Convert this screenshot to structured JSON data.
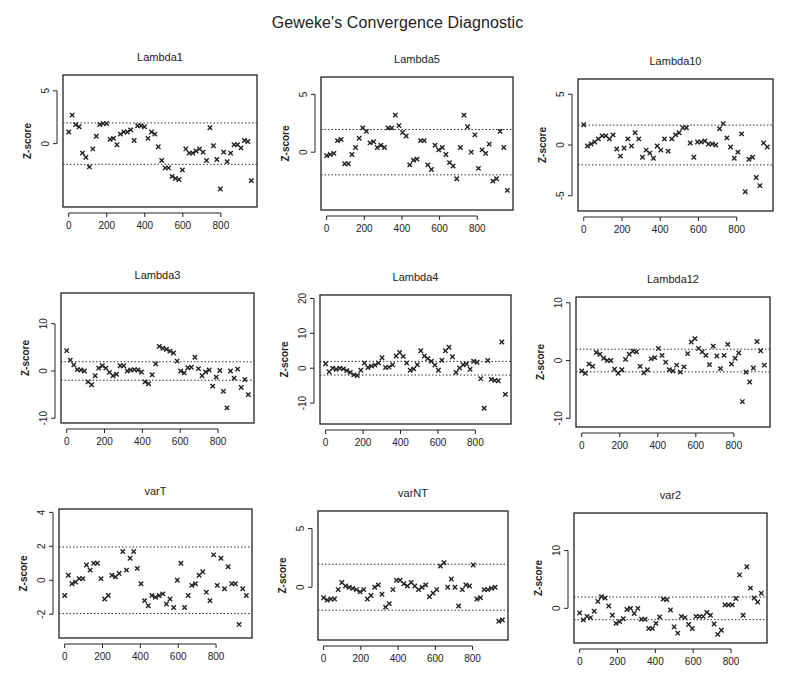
{
  "title": "Geweke's Convergence Diagnostic",
  "chart_data": [
    {
      "type": "scatter",
      "title": "Lambda1",
      "xlabel": "",
      "ylabel": "Z-score",
      "xlim": [
        -30,
        990
      ],
      "ylim": [
        -6,
        6.5
      ],
      "xticks": [
        0,
        200,
        400,
        600,
        800
      ],
      "yticks": [
        0,
        5
      ],
      "hlines": [
        1.96,
        -1.96
      ],
      "grid": false,
      "marker": "x",
      "y": [
        1.1,
        2.7,
        1.8,
        1.6,
        -0.9,
        -1.3,
        -2.2,
        -0.5,
        0.7,
        1.8,
        1.9,
        1.9,
        0.4,
        0.5,
        -0.1,
        0.9,
        1.1,
        1.1,
        1.3,
        0.3,
        1.7,
        1.7,
        1.6,
        0.5,
        1.1,
        0.9,
        -0.3,
        -1.6,
        -2.3,
        -2.3,
        -3.1,
        -3.3,
        -3.4,
        -2.5,
        -0.5,
        -0.9,
        -0.9,
        -0.7,
        -0.5,
        -0.8,
        -1.6,
        1.5,
        -0.2,
        -1.5,
        -4.3,
        -0.8,
        -1.7,
        -0.9,
        -0.1,
        -0.1,
        -0.4,
        0.3,
        0.2,
        -3.5
      ]
    },
    {
      "type": "scatter",
      "title": "Lambda5",
      "xlabel": "",
      "ylabel": "Z-score",
      "xlim": [
        -30,
        990
      ],
      "ylim": [
        -5,
        6.5
      ],
      "xticks": [
        0,
        200,
        400,
        600,
        800
      ],
      "yticks": [
        0,
        5
      ],
      "hlines": [
        1.96,
        -1.96
      ],
      "grid": false,
      "marker": "x",
      "y": [
        -0.3,
        -0.2,
        -0.1,
        1.0,
        1.1,
        -1.0,
        -1.0,
        -0.2,
        0.4,
        1.2,
        2.1,
        1.8,
        0.8,
        0.9,
        0.4,
        0.6,
        0.4,
        2.1,
        2.1,
        3.2,
        2.3,
        1.7,
        1.4,
        -1.1,
        -0.7,
        -0.6,
        1.0,
        1.0,
        -1.1,
        -1.5,
        0.6,
        0.2,
        0.4,
        -0.2,
        -0.9,
        -1.2,
        -2.3,
        0.4,
        3.2,
        2.2,
        0.0,
        1.5,
        -1.4,
        0.2,
        -0.1,
        0.7,
        -2.5,
        -2.3,
        1.8,
        0.4,
        -3.3
      ]
    },
    {
      "type": "scatter",
      "title": "Lambda10",
      "xlabel": "",
      "ylabel": "Z-score",
      "xlim": [
        -30,
        990
      ],
      "ylim": [
        -6.5,
        6.5
      ],
      "xticks": [
        0,
        200,
        400,
        600,
        800
      ],
      "yticks": [
        -5,
        0,
        5
      ],
      "hlines": [
        1.96,
        -1.96
      ],
      "grid": false,
      "marker": "x",
      "y": [
        2.0,
        -0.1,
        0.1,
        0.3,
        0.6,
        0.9,
        0.9,
        0.6,
        1.0,
        -0.4,
        -1.1,
        -0.3,
        0.6,
        -0.1,
        1.2,
        0.6,
        -1.2,
        -0.5,
        -0.8,
        -1.3,
        -0.1,
        -0.5,
        0.6,
        -0.6,
        0.6,
        1.0,
        1.2,
        1.7,
        1.7,
        0.2,
        -1.2,
        0.3,
        0.3,
        0.4,
        0.1,
        0.1,
        0.0,
        1.6,
        2.1,
        0.7,
        -0.2,
        -1.3,
        -0.7,
        1.1,
        -4.6,
        -1.4,
        -1.2,
        -3.2,
        -4.0,
        0.2,
        -0.2
      ]
    },
    {
      "type": "scatter",
      "title": "Lambda3",
      "xlabel": "",
      "ylabel": "Z-score",
      "xlim": [
        -30,
        990
      ],
      "ylim": [
        -11,
        16.5
      ],
      "xticks": [
        0,
        200,
        400,
        600,
        800
      ],
      "yticks": [
        -10,
        0,
        10
      ],
      "hlines": [
        1.96,
        -1.96
      ],
      "grid": false,
      "marker": "x",
      "y": [
        4.3,
        2.3,
        1.3,
        0.3,
        0.2,
        0.0,
        -2.3,
        -2.9,
        -1.0,
        0.6,
        1.1,
        0.6,
        -0.3,
        -1.0,
        -0.7,
        1.1,
        1.1,
        0.0,
        0.2,
        0.3,
        0.2,
        -0.2,
        -2.3,
        -2.7,
        -0.8,
        1.5,
        5.2,
        4.8,
        4.6,
        4.2,
        3.8,
        2.1,
        0.0,
        -0.4,
        0.7,
        0.8,
        2.9,
        0.5,
        -1.0,
        -0.2,
        0.2,
        -3.2,
        -1.3,
        0.1,
        -4.3,
        -7.8,
        0.0,
        -1.5,
        0.4,
        -3.5,
        -1.8,
        -5.0
      ]
    },
    {
      "type": "scatter",
      "title": "Lambda4",
      "xlabel": "",
      "ylabel": "Z-score",
      "xlim": [
        -30,
        990
      ],
      "ylim": [
        -16,
        21
      ],
      "xticks": [
        0,
        200,
        400,
        600,
        800
      ],
      "yticks": [
        -10,
        0,
        10,
        20
      ],
      "hlines": [
        1.96,
        -1.96
      ],
      "grid": false,
      "marker": "x",
      "y": [
        1.3,
        -1.0,
        0.0,
        -0.3,
        0.0,
        -0.2,
        -0.7,
        -1.2,
        -1.9,
        -2.1,
        -0.6,
        1.5,
        0.2,
        0.6,
        0.9,
        1.5,
        3.0,
        0.2,
        0.3,
        1.0,
        3.5,
        4.5,
        3.4,
        1.5,
        -0.6,
        -0.2,
        1.0,
        5.0,
        3.5,
        2.8,
        2.0,
        0.9,
        -0.6,
        2.3,
        5.0,
        6.0,
        3.3,
        -1.2,
        0.1,
        1.0,
        1.2,
        -0.3,
        2.0,
        1.7,
        -3.0,
        -11.5,
        2.2,
        -3.2,
        -3.5,
        -3.6,
        7.5,
        -7.5
      ]
    },
    {
      "type": "scatter",
      "title": "Lambda12",
      "xlabel": "",
      "ylabel": "Z-score",
      "xlim": [
        -30,
        990
      ],
      "ylim": [
        -11.5,
        11
      ],
      "xticks": [
        0,
        200,
        400,
        600,
        800
      ],
      "yticks": [
        -10,
        0,
        10
      ],
      "hlines": [
        1.96,
        -1.96
      ],
      "grid": false,
      "marker": "x",
      "y": [
        -1.8,
        -2.2,
        -0.6,
        -1.0,
        1.4,
        1.1,
        0.4,
        0.0,
        0.0,
        -1.5,
        -2.2,
        -1.6,
        0.2,
        1.1,
        1.6,
        1.5,
        -1.0,
        -2.1,
        -1.6,
        0.3,
        0.5,
        2.1,
        0.9,
        -0.3,
        -1.6,
        -1.8,
        -0.8,
        -2.0,
        -1.1,
        1.2,
        3.2,
        3.8,
        2.1,
        1.5,
        0.9,
        -0.7,
        2.5,
        0.8,
        -1.4,
        0.9,
        2.8,
        -0.6,
        0.4,
        1.3,
        -7.1,
        -2.0,
        -3.7,
        -1.3,
        3.3,
        1.7,
        -0.8
      ]
    },
    {
      "type": "scatter",
      "title": "varT",
      "xlabel": "",
      "ylabel": "Z-score",
      "xlim": [
        -30,
        990
      ],
      "ylim": [
        -3.4,
        4.2
      ],
      "xticks": [
        0,
        200,
        400,
        600,
        800
      ],
      "yticks": [
        -2,
        0,
        2,
        4
      ],
      "hlines": [
        1.96,
        -1.96
      ],
      "grid": false,
      "marker": "x",
      "y": [
        -0.9,
        0.3,
        -0.2,
        -0.1,
        0.1,
        0.1,
        0.9,
        0.6,
        1.0,
        1.0,
        0.1,
        -1.1,
        -0.9,
        0.3,
        0.2,
        0.4,
        1.7,
        0.6,
        1.3,
        1.7,
        0.7,
        -0.2,
        -1.2,
        -1.5,
        -0.9,
        -1.0,
        -0.9,
        -0.8,
        -1.4,
        -1.1,
        -1.6,
        0.0,
        1.0,
        -1.6,
        -0.9,
        -0.3,
        -0.2,
        0.3,
        0.5,
        -0.7,
        -1.2,
        1.5,
        -0.3,
        1.3,
        -0.5,
        0.8,
        -0.2,
        -0.2,
        -2.6,
        -0.5,
        -0.9
      ]
    },
    {
      "type": "scatter",
      "title": "varNT",
      "xlabel": "",
      "ylabel": "Z-score",
      "xlim": [
        -30,
        990
      ],
      "ylim": [
        -4.5,
        6.5
      ],
      "xticks": [
        0,
        200,
        400,
        600,
        800
      ],
      "yticks": [
        0,
        5
      ],
      "hlines": [
        1.96,
        -1.96
      ],
      "grid": false,
      "marker": "x",
      "y": [
        -0.9,
        -1.1,
        -1.0,
        -1.0,
        -0.2,
        0.4,
        0.1,
        0.0,
        -0.1,
        -0.2,
        -0.4,
        -0.2,
        -1.0,
        -0.7,
        0.0,
        0.2,
        -0.6,
        -1.7,
        -1.4,
        -0.2,
        0.6,
        0.6,
        0.3,
        0.1,
        0.4,
        0.1,
        -0.2,
        0.0,
        0.2,
        -0.8,
        -0.5,
        -0.2,
        1.8,
        2.1,
        0.0,
        0.7,
        0.0,
        -1.6,
        -0.2,
        0.2,
        0.1,
        1.9,
        -1.0,
        -0.9,
        -0.2,
        -0.2,
        -0.1,
        0.0,
        -2.9,
        -2.8
      ]
    },
    {
      "type": "scatter",
      "title": "var2",
      "xlabel": "",
      "ylabel": "Z-score",
      "xlim": [
        -30,
        990
      ],
      "ylim": [
        -6,
        16.5
      ],
      "xticks": [
        0,
        200,
        400,
        600,
        800
      ],
      "yticks": [
        0,
        10
      ],
      "hlines": [
        1.96,
        -1.96
      ],
      "grid": false,
      "marker": "x",
      "y": [
        -0.8,
        -2.0,
        -1.4,
        -1.6,
        -0.5,
        1.2,
        2.0,
        1.8,
        0.4,
        -1.2,
        -2.6,
        -2.3,
        -1.8,
        -0.2,
        0.0,
        -0.9,
        0.0,
        -1.9,
        -1.9,
        -3.5,
        -3.5,
        -2.6,
        -1.5,
        1.6,
        1.5,
        -0.3,
        -3.2,
        -4.3,
        -1.4,
        -1.6,
        -2.8,
        -3.5,
        -1.4,
        -1.4,
        -1.4,
        -0.7,
        -1.2,
        -2.7,
        -4.5,
        -3.8,
        0.6,
        0.6,
        0.6,
        1.7,
        5.8,
        -1.2,
        7.2,
        3.5,
        1.8,
        1.1,
        2.6
      ]
    }
  ]
}
